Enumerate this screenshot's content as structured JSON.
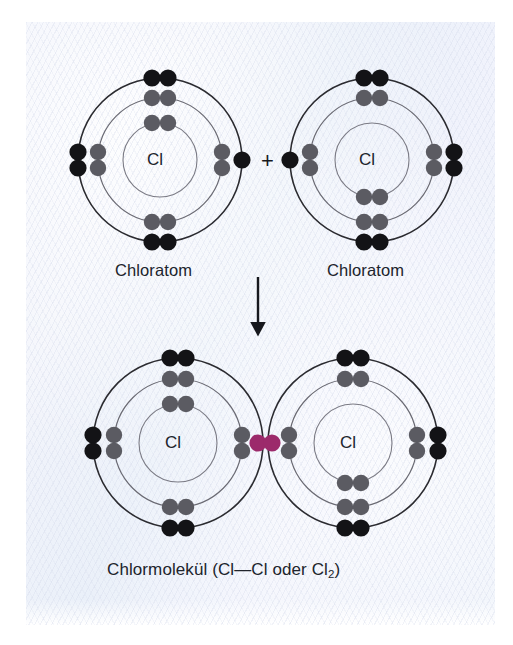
{
  "figure": {
    "title_text": "Chloratom + Chloratom -> Chlormolekuel",
    "background_color": "#eef1fb",
    "page_color": "#ffffff",
    "shell_stroke_color": "#2b2b30",
    "inner_shell_stroke_color": "#6f6f78",
    "nucleus_label": "Cl",
    "electron_colors": {
      "outer_black": "#131316",
      "inner_gray": "#5b5b62",
      "shared_pair": "#9c2a6b"
    }
  },
  "reaction": {
    "plus_sign": "+",
    "arrow_name": "down-arrow"
  },
  "top_row": {
    "left_atom": {
      "label": "Chloratom",
      "nucleus": "Cl",
      "center": {
        "x": 160,
        "y": 160
      },
      "shells": [
        37,
        62,
        82
      ],
      "electrons": {
        "outer_pairs_deg": [
          90,
          180,
          270
        ],
        "outer_single_deg": [
          0
        ],
        "middle_pairs_deg": [
          90,
          180,
          270,
          0
        ],
        "inner_pairs_deg": [
          90
        ]
      }
    },
    "right_atom": {
      "label": "Chloratom",
      "nucleus": "Cl",
      "center": {
        "x": 372,
        "y": 160
      },
      "shells": [
        37,
        62,
        82
      ],
      "electrons": {
        "outer_pairs_deg": [
          90,
          0,
          270
        ],
        "outer_single_deg": [
          180
        ],
        "middle_pairs_deg": [
          90,
          180,
          270,
          0
        ],
        "inner_pairs_deg": [
          270
        ]
      }
    }
  },
  "bottom_row": {
    "caption_prefix": "Chlormolekül (Cl—Cl oder Cl",
    "caption_sub": "2",
    "caption_suffix": ")",
    "caption_full": "Chlormolekül (Cl—Cl oder Cl2)",
    "left_atom": {
      "nucleus": "Cl",
      "center": {
        "x": 178,
        "y": 443
      },
      "shells": [
        39,
        64,
        85
      ],
      "electrons": {
        "outer_pairs_deg": [
          90,
          180,
          270,
          0
        ],
        "middle_pairs_deg": [
          90,
          180,
          270,
          0
        ],
        "inner_pairs_deg": [
          90
        ]
      }
    },
    "right_atom": {
      "nucleus": "Cl",
      "center": {
        "x": 353,
        "y": 443
      },
      "shells": [
        39,
        64,
        85
      ],
      "electrons": {
        "outer_pairs_deg": [
          90,
          180,
          270,
          0
        ],
        "middle_pairs_deg": [
          90,
          180,
          270,
          0
        ],
        "inner_pairs_deg": [
          270
        ]
      }
    },
    "shared_pair": {
      "name": "shared-electron-pair",
      "center": {
        "x": 265,
        "y": 443
      },
      "color": "#9c2a6b"
    }
  }
}
